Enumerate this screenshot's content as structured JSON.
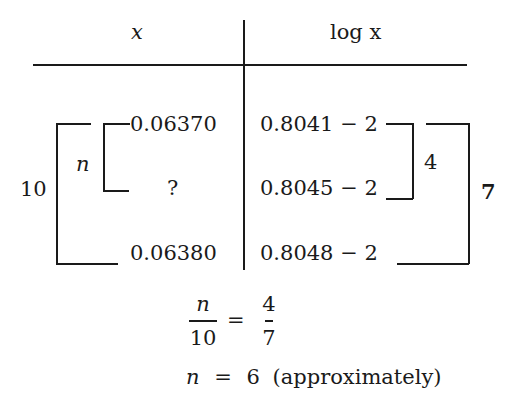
{
  "table": {
    "headers": {
      "x": "x",
      "log_x": "log x"
    },
    "x_values": [
      "0.06370",
      "?",
      "0.06380"
    ],
    "log_values": [
      "0.8041 − 2",
      "0.8045 − 2",
      "0.8048 − 2"
    ],
    "brackets": {
      "left_outer_label": "10",
      "left_inner_label": "n",
      "right_inner_label": "4",
      "right_outer_label": "7"
    }
  },
  "equation": {
    "lhs_numerator": "n",
    "lhs_denominator": "10",
    "equals": "=",
    "rhs_numerator": "4",
    "rhs_denominator": "7"
  },
  "result": {
    "variable": "n",
    "equals": "=",
    "value": "6",
    "note": "(approximately)"
  }
}
